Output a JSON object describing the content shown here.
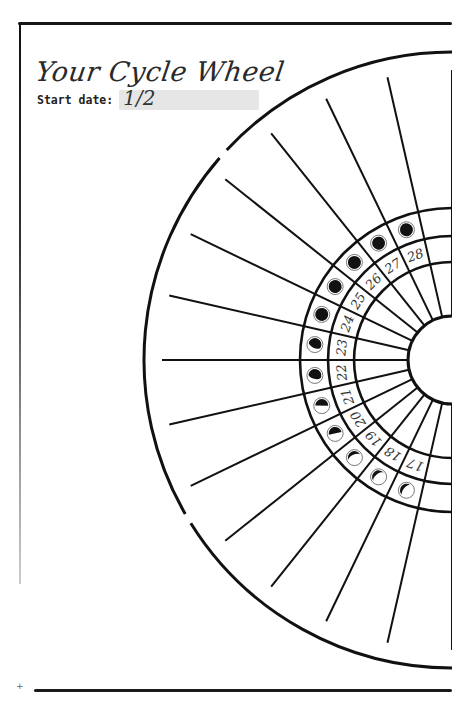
{
  "page": {
    "title": "Your Cycle Wheel",
    "start_date": {
      "label": "Start date:",
      "value": "1/2"
    }
  },
  "wheel": {
    "center": [
      452,
      360
    ],
    "radii": {
      "outer": 308,
      "spoke_start": 290,
      "moon_outer": 152,
      "moon_inner": 124,
      "number_inner": 98,
      "hub": 44
    },
    "cycle_length": 28,
    "visible_days": [
      {
        "day": "28",
        "moon": "full"
      },
      {
        "day": "27",
        "moon": "full"
      },
      {
        "day": "26",
        "moon": "full"
      },
      {
        "day": "25",
        "moon": "full"
      },
      {
        "day": "24",
        "moon": "full"
      },
      {
        "day": "23",
        "moon": "waning-gibbous"
      },
      {
        "day": "22",
        "moon": "waning-gibbous"
      },
      {
        "day": "21",
        "moon": "last-quarter"
      },
      {
        "day": "20",
        "moon": "last-quarter"
      },
      {
        "day": "19",
        "moon": "waning-crescent"
      },
      {
        "day": "18",
        "moon": "waning-crescent"
      },
      {
        "day": "17",
        "moon": "waning-crescent"
      }
    ],
    "colors": {
      "ink": "#111111",
      "moon_outline": "#555555"
    }
  }
}
